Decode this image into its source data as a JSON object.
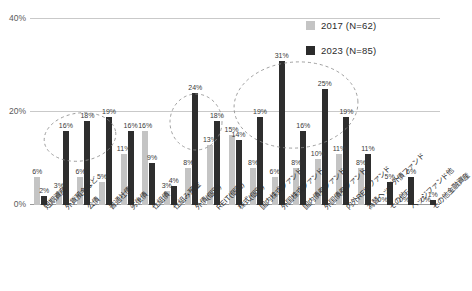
{
  "title_strip": "",
  "legend": {
    "position": "top-right",
    "entries": [
      {
        "label": "2017 (N=62)",
        "color": "#c4c4c4",
        "name": "2017"
      },
      {
        "label": "2023 (N=85)",
        "color": "#2b2b2b",
        "name": "2023"
      }
    ]
  },
  "chart_data": {
    "type": "bar",
    "title": "",
    "xlabel": "",
    "ylabel": "",
    "ylim": [
      0,
      40
    ],
    "yticks": [
      "0%",
      "20%",
      "40%"
    ],
    "ytick_values": [
      0,
      20,
      40
    ],
    "grid": true,
    "legend_position": "top-right",
    "categories": [
      "短期資産",
      "外貨預金など",
      "公債",
      "普通社債",
      "劣後債",
      "仕組債",
      "仕組み預金",
      "外債(個別)",
      "REIT(個別)",
      "株式(個別)",
      "国内株式ファンド",
      "外国株式ファンド",
      "国内債券ファンド",
      "外国債券ファンド",
      "内外REITファンド",
      "為替ヘッジ外債ファンド",
      "その他F",
      "ヘッジファンド他",
      "その他金融資産"
    ],
    "series": [
      {
        "name": "2017 (N=62)",
        "color": "#c4c4c4",
        "values": [
          6,
          3,
          6,
          5,
          11,
          16,
          3,
          8,
          13,
          15,
          8,
          6,
          8,
          10,
          11,
          8,
          0,
          0,
          0
        ],
        "labels": [
          "6%",
          "3%",
          "6%",
          "5%",
          "11%",
          "16%",
          "3%",
          "8%",
          "13%",
          "15%",
          "8%",
          "6%",
          "8%",
          "10%",
          "11%",
          "8%",
          "0%",
          "0%",
          "0%"
        ]
      },
      {
        "name": "2023 (N=85)",
        "color": "#2b2b2b",
        "values": [
          2,
          16,
          18,
          19,
          16,
          9,
          4,
          24,
          18,
          14,
          19,
          31,
          16,
          25,
          19,
          11,
          5,
          6,
          1
        ],
        "labels": [
          "2%",
          "16%",
          "18%",
          "19%",
          "16%",
          "9%",
          "4%",
          "24%",
          "18%",
          "14%",
          "19%",
          "31%",
          "16%",
          "25%",
          "19%",
          "11%",
          "5%",
          "6%",
          "1%"
        ]
      }
    ],
    "annotations": [
      {
        "name": "highlight-ellipse-left",
        "shape": "dashed-ellipse",
        "covers": [
          "外貨預金など",
          "公債",
          "普通社債",
          "劣後債"
        ]
      },
      {
        "name": "highlight-ellipse-middle",
        "shape": "dashed-ellipse",
        "covers": [
          "外債(個別)",
          "REIT(個別)"
        ]
      },
      {
        "name": "highlight-ellipse-right",
        "shape": "dashed-ellipse",
        "covers": [
          "国内株式ファンド",
          "外国株式ファンド",
          "国内債券ファンド",
          "外国債券ファンド",
          "内外REITファンド"
        ]
      }
    ]
  }
}
